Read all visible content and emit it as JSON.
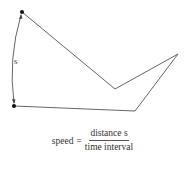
{
  "diagram": {
    "arc_label": "s",
    "path_points": [
      [
        22,
        12
      ],
      [
        115,
        89
      ],
      [
        178,
        54
      ],
      [
        135,
        111
      ],
      [
        14,
        106
      ]
    ],
    "colors": {
      "path": "#666666",
      "dot": "#111111"
    }
  },
  "formula": {
    "lhs": "speed",
    "equals": "=",
    "numerator": "distance s",
    "denominator": "time interval"
  }
}
